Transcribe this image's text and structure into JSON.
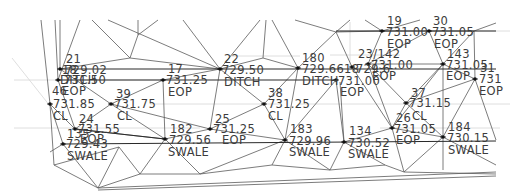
{
  "drawing": {
    "type": "survey-tin-plan",
    "colors": {
      "background": "#ffffff",
      "tin_lines": "#5a5a5a",
      "grid_lines": "#d6d6d6",
      "breaklines": "#2a2a2a",
      "text": "#3c3c3c",
      "node": "#111111"
    },
    "points": [
      {
        "id": "21",
        "elev": "729.02",
        "desc": "DITCH",
        "x": 60,
        "y": 69
      },
      {
        "id": "20",
        "elev": "731.50",
        "desc": "EOP",
        "x": 58,
        "y": 80
      },
      {
        "id": "46",
        "elev": "731.85",
        "desc": "CL",
        "x": 50,
        "y": 104
      },
      {
        "id": "39",
        "elev": "731.75",
        "desc": "CL",
        "x": 111,
        "y": 104
      },
      {
        "id": "24",
        "elev": "731.55",
        "desc": "EOP",
        "x": 75,
        "y": 129
      },
      {
        "id": "135",
        "elev": "729.43",
        "desc": "SWALE",
        "x": 63,
        "y": 144
      },
      {
        "id": "17",
        "elev": "731.25",
        "desc": "EOP",
        "x": 163,
        "y": 80
      },
      {
        "id": "22",
        "elev": "729.50",
        "desc": "DITCH",
        "x": 220,
        "y": 69
      },
      {
        "id": "38",
        "elev": "731.25",
        "desc": "CL",
        "x": 264,
        "y": 104
      },
      {
        "id": "25",
        "elev": "731.25",
        "desc": "EOP",
        "x": 210,
        "y": 129
      },
      {
        "id": "182",
        "elev": "729.56",
        "desc": "SWALE",
        "x": 165,
        "y": 139
      },
      {
        "id": "180",
        "elev": "729.66",
        "desc": "DITCH",
        "x": 298,
        "y": 68
      },
      {
        "id": "18",
        "elev": "729.61",
        "desc": "DITCH",
        "x": 352,
        "y": 67
      },
      {
        "id": "23",
        "elev": "731.00",
        "desc": "EOP",
        "x": 336,
        "y": 80
      },
      {
        "id": "142",
        "elev": "731.00",
        "desc": "EOP",
        "x": 368,
        "y": 64
      },
      {
        "id": "19",
        "elev": "731.00",
        "desc": "EOP",
        "x": 382,
        "y": 31
      },
      {
        "id": "30",
        "elev": "731.05",
        "desc": "EOP",
        "x": 429,
        "y": 31
      },
      {
        "id": "143",
        "elev": "731.05",
        "desc": "EOP",
        "x": 443,
        "y": 64
      },
      {
        "id": "31",
        "elev": "731",
        "desc": "EOP",
        "x": 475,
        "y": 79
      },
      {
        "id": "37",
        "elev": "731.15",
        "desc": "CL",
        "x": 406,
        "y": 103
      },
      {
        "id": "26",
        "elev": "731.05",
        "desc": "EOP",
        "x": 392,
        "y": 128
      },
      {
        "id": "183",
        "elev": "729.96",
        "desc": "SWALE",
        "x": 285,
        "y": 140
      },
      {
        "id": "134",
        "elev": "730.52",
        "desc": "SWALE",
        "x": 344,
        "y": 142
      },
      {
        "id": "184",
        "elev": "730.15",
        "desc": "SWALE",
        "x": 443,
        "y": 137
      }
    ],
    "labels": [
      {
        "text": "21",
        "x": 66,
        "y": 63
      },
      {
        "text": "729.02",
        "x": 65,
        "y": 74
      },
      {
        "text": "DITCH",
        "x": 60,
        "y": 84
      },
      {
        "text": "731.50",
        "x": 64,
        "y": 84
      },
      {
        "text": "18",
        "x": 62,
        "y": 74
      },
      {
        "text": "EOP",
        "x": 62,
        "y": 95
      },
      {
        "text": "46",
        "x": 52,
        "y": 95
      },
      {
        "text": "731.85",
        "x": 53,
        "y": 108
      },
      {
        "text": "CL",
        "x": 53,
        "y": 120
      },
      {
        "text": "39",
        "x": 116,
        "y": 98
      },
      {
        "text": "731.75",
        "x": 114,
        "y": 108
      },
      {
        "text": "CL",
        "x": 117,
        "y": 120
      },
      {
        "text": "24",
        "x": 79,
        "y": 123
      },
      {
        "text": "731.55",
        "x": 78,
        "y": 133
      },
      {
        "text": "135",
        "x": 67,
        "y": 138
      },
      {
        "text": "EOP",
        "x": 80,
        "y": 143
      },
      {
        "text": "729.43",
        "x": 66,
        "y": 148
      },
      {
        "text": "SWALE",
        "x": 67,
        "y": 160
      },
      {
        "text": "17",
        "x": 168,
        "y": 73
      },
      {
        "text": "731.25",
        "x": 166,
        "y": 84
      },
      {
        "text": "EOP",
        "x": 168,
        "y": 96
      },
      {
        "text": "22",
        "x": 224,
        "y": 63
      },
      {
        "text": "729.50",
        "x": 222,
        "y": 74
      },
      {
        "text": "DITCH",
        "x": 224,
        "y": 86
      },
      {
        "text": "38",
        "x": 268,
        "y": 97
      },
      {
        "text": "731.25",
        "x": 268,
        "y": 108
      },
      {
        "text": "CL",
        "x": 268,
        "y": 120
      },
      {
        "text": "25",
        "x": 215,
        "y": 123
      },
      {
        "text": "731.25",
        "x": 213,
        "y": 133
      },
      {
        "text": "EOP",
        "x": 222,
        "y": 144
      },
      {
        "text": "182",
        "x": 170,
        "y": 133
      },
      {
        "text": "729.56",
        "x": 169,
        "y": 144
      },
      {
        "text": "SWALE",
        "x": 168,
        "y": 156
      },
      {
        "text": "180",
        "x": 302,
        "y": 62
      },
      {
        "text": "729.6618",
        "x": 302,
        "y": 73
      },
      {
        "text": "DITCH",
        "x": 302,
        "y": 85
      },
      {
        "text": "731.00",
        "x": 338,
        "y": 85
      },
      {
        "text": "EOP",
        "x": 340,
        "y": 96
      },
      {
        "text": "23/142",
        "x": 358,
        "y": 58
      },
      {
        "text": "729.6",
        "x": 356,
        "y": 73
      },
      {
        "text": "731.00",
        "x": 371,
        "y": 69
      },
      {
        "text": "EOP",
        "x": 372,
        "y": 80
      },
      {
        "text": "19",
        "x": 387,
        "y": 25
      },
      {
        "text": "731.00",
        "x": 386,
        "y": 36
      },
      {
        "text": "EOP",
        "x": 387,
        "y": 48
      },
      {
        "text": "30",
        "x": 433,
        "y": 25
      },
      {
        "text": "731.05",
        "x": 432,
        "y": 36
      },
      {
        "text": "EOP",
        "x": 434,
        "y": 48
      },
      {
        "text": "143",
        "x": 447,
        "y": 58
      },
      {
        "text": "731.05",
        "x": 446,
        "y": 69
      },
      {
        "text": "EOP",
        "x": 446,
        "y": 80
      },
      {
        "text": "31",
        "x": 480,
        "y": 72
      },
      {
        "text": "731",
        "x": 479,
        "y": 83
      },
      {
        "text": "EOP",
        "x": 479,
        "y": 95
      },
      {
        "text": "37",
        "x": 411,
        "y": 97
      },
      {
        "text": "731.15",
        "x": 409,
        "y": 107
      },
      {
        "text": "CL",
        "x": 412,
        "y": 120
      },
      {
        "text": "26",
        "x": 396,
        "y": 122
      },
      {
        "text": "731.05",
        "x": 394,
        "y": 133
      },
      {
        "text": "EOP",
        "x": 396,
        "y": 144
      },
      {
        "text": "183",
        "x": 290,
        "y": 133
      },
      {
        "text": "729.96",
        "x": 289,
        "y": 145
      },
      {
        "text": "SWALE",
        "x": 289,
        "y": 156
      },
      {
        "text": "134",
        "x": 349,
        "y": 135
      },
      {
        "text": "730.52",
        "x": 348,
        "y": 147
      },
      {
        "text": "SWALE",
        "x": 348,
        "y": 158
      },
      {
        "text": "184",
        "x": 448,
        "y": 131
      },
      {
        "text": "730.15",
        "x": 447,
        "y": 142
      },
      {
        "text": "SWALE",
        "x": 448,
        "y": 154
      }
    ]
  }
}
